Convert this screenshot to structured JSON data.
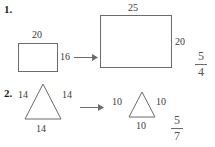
{
  "page": {
    "background_color": "#ffffff",
    "stroke_color": "#6b6b6b",
    "text_color": "#3a3a3a"
  },
  "problems": [
    {
      "number": "1.",
      "figure_type": "rectangle",
      "left_figure": {
        "shape": "rectangle",
        "top_label": "20",
        "right_label": "16"
      },
      "arrow": "right-arrow",
      "right_figure": {
        "shape": "rectangle",
        "top_label": "25",
        "right_label": "20"
      },
      "answer": {
        "numerator": "5",
        "denominator": "4"
      }
    },
    {
      "number": "2.",
      "figure_type": "triangle",
      "left_figure": {
        "shape": "triangle",
        "left_label": "14",
        "right_label": "14",
        "bottom_label": "14"
      },
      "arrow": "right-arrow",
      "right_figure": {
        "shape": "triangle",
        "left_label": "10",
        "right_label": "10",
        "bottom_label": "10"
      },
      "answer": {
        "numerator": "5",
        "denominator": "7"
      }
    }
  ]
}
